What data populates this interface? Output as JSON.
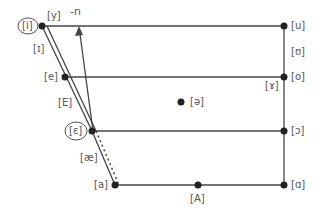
{
  "diagram": {
    "colors": {
      "line": "#444444",
      "point": "#222222",
      "label": "#555555"
    },
    "arrow_label": "-n",
    "vowels": {
      "i": "[i]",
      "y": "[y]",
      "u": "[u]",
      "I": "[ɪ]",
      "U": "[ʊ]",
      "e": "[e]",
      "o": "[o]",
      "gamma": "[ɤ]",
      "E": "[E]",
      "schwa": "[ə]",
      "epsilon": "[ɛ]",
      "open_o": "[ɔ]",
      "ae": "[æ]",
      "a": "[a]",
      "A": "[A]",
      "alpha": "[ɑ]"
    },
    "circled": [
      "[i]",
      "[ɛ]"
    ]
  }
}
